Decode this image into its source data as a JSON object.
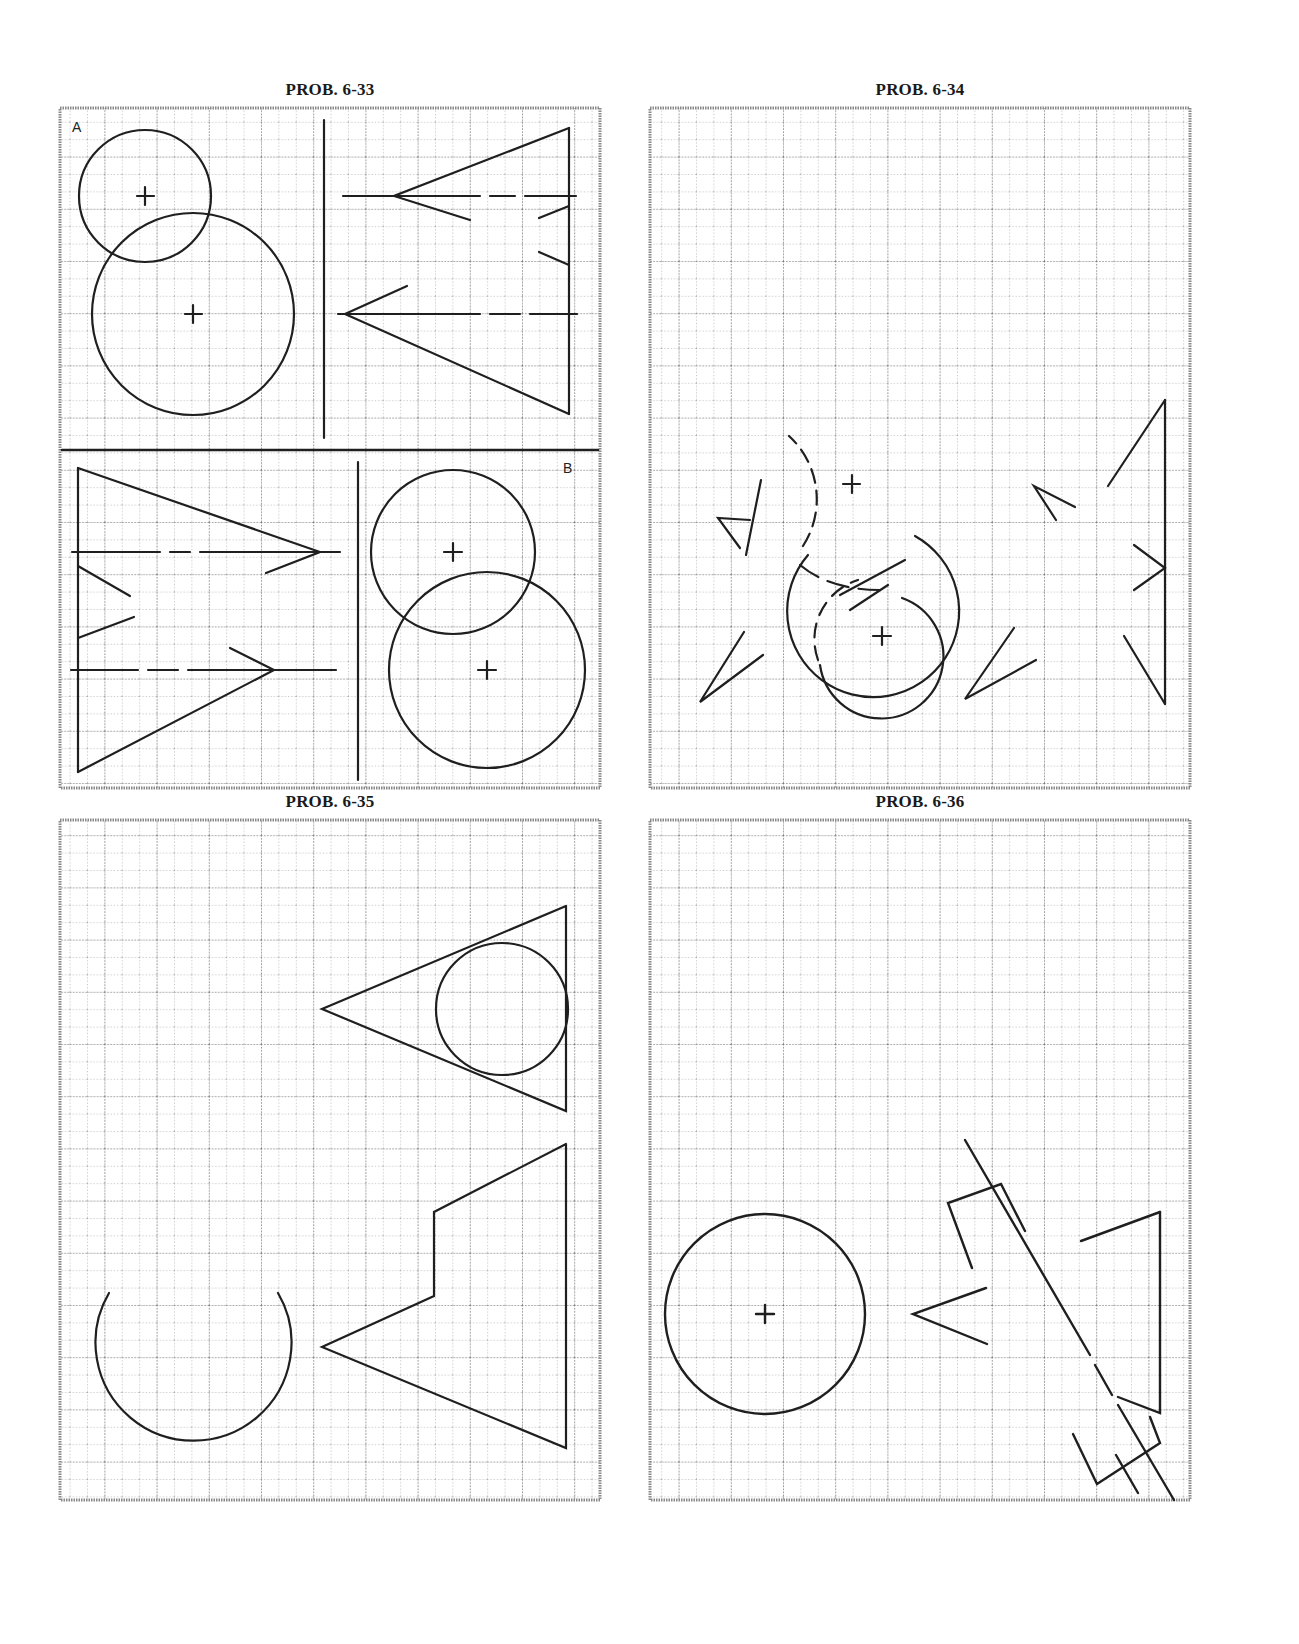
{
  "colors": {
    "ink": "#1f1f1f",
    "grid_minor": "#9a9a9a",
    "grid_major": "#7a7a7a",
    "frame": "#888888",
    "paper": "#ffffff"
  },
  "panels": [
    {
      "id": "prob-6-33",
      "title": "PROB. 6-33",
      "corner_labels": [
        "A",
        "B"
      ]
    },
    {
      "id": "prob-6-34",
      "title": "PROB. 6-34"
    },
    {
      "id": "prob-6-35",
      "title": "PROB. 6-35"
    },
    {
      "id": "prob-6-36",
      "title": "PROB. 6-36"
    }
  ]
}
